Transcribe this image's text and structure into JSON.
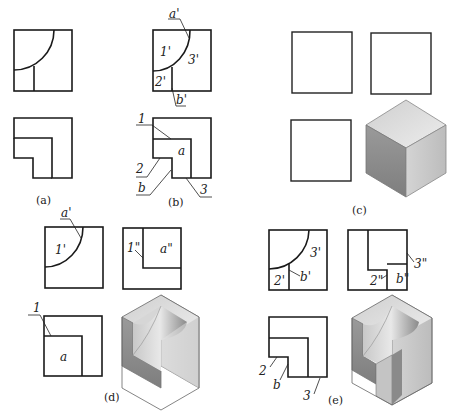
{
  "figure": {
    "panels": [
      {
        "id": "a",
        "caption": "(a)",
        "labels": []
      },
      {
        "id": "b",
        "caption": "(b)",
        "labels": [
          "a'",
          "1'",
          "3'",
          "2'",
          "b'",
          "1",
          "a",
          "2",
          "b",
          "3"
        ]
      },
      {
        "id": "c",
        "caption": "(c)",
        "labels": []
      },
      {
        "id": "d",
        "caption": "(d)",
        "labels": [
          "a'",
          "1'",
          "1\"",
          "a\"",
          "1",
          "a"
        ]
      },
      {
        "id": "e",
        "caption": "(e)",
        "labels": [
          "3'",
          "2'",
          "b'",
          "3\"",
          "2\"",
          "b\"",
          "2",
          "b",
          "3"
        ]
      }
    ],
    "colors": {
      "line": "#1a1a1a",
      "face_top": "#dcdcdc",
      "face_left": "#8c8c8c",
      "face_right": "#c8c8c8",
      "inner": "#b0b0b0"
    }
  }
}
